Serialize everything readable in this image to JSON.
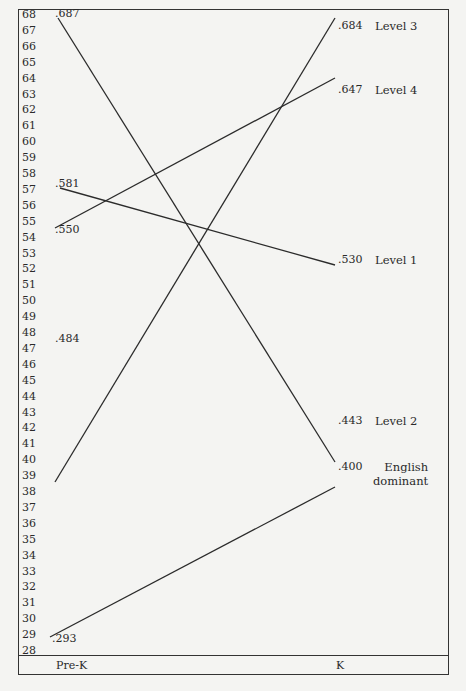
{
  "chart_data": {
    "type": "line",
    "title": "",
    "xlabel": "",
    "ylabel": "",
    "categories": [
      "Pre-K",
      "K"
    ],
    "y_ticks": [
      68,
      67,
      66,
      65,
      64,
      63,
      62,
      61,
      60,
      59,
      58,
      57,
      56,
      55,
      54,
      53,
      52,
      51,
      50,
      49,
      48,
      47,
      46,
      45,
      44,
      43,
      42,
      41,
      40,
      39,
      38,
      37,
      36,
      35,
      34,
      33,
      32,
      31,
      30,
      29,
      28
    ],
    "ylim": [
      28,
      68
    ],
    "grid": false,
    "legend_position": "right-end labels",
    "series": [
      {
        "name": "Level 3",
        "values": [
          0.484,
          0.684
        ],
        "start_label": ".484",
        "end_label": ".684",
        "px": [
          [
            55,
            482
          ],
          [
            335,
            18
          ]
        ]
      },
      {
        "name": "Level 4",
        "values": [
          0.55,
          0.647
        ],
        "start_label": ".550",
        "end_label": ".647",
        "px": [
          [
            55,
            228
          ],
          [
            335,
            78
          ]
        ]
      },
      {
        "name": "Level 1",
        "values": [
          0.581,
          0.53
        ],
        "start_label": ".581",
        "end_label": ".530",
        "px": [
          [
            60,
            188
          ],
          [
            335,
            265
          ]
        ]
      },
      {
        "name": "Level 2",
        "values": [
          0.687,
          0.443
        ],
        "start_label": ".687",
        "end_label": ".443",
        "px": [
          [
            58,
            18
          ],
          [
            335,
            462
          ]
        ]
      },
      {
        "name": "English dominant",
        "values": [
          0.293,
          0.4
        ],
        "start_label": ".293",
        "end_label": ".400",
        "px": [
          [
            50,
            637
          ],
          [
            335,
            487
          ]
        ]
      }
    ]
  },
  "labels": {
    "pre_k": "Pre-K",
    "k": "K",
    "level3": "Level 3",
    "level4": "Level 4",
    "level1": "Level 1",
    "level2": "Level 2",
    "english_dominant": "English\ndominant"
  },
  "values": {
    "pre_687": ".687",
    "pre_581": ".581",
    "pre_550": ".550",
    "pre_484": ".484",
    "pre_293": ".293",
    "k_684": ".684",
    "k_647": ".647",
    "k_530": ".530",
    "k_443": ".443",
    "k_400": ".400"
  }
}
